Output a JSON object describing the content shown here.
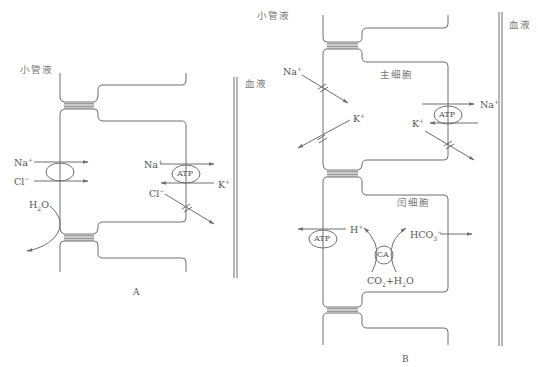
{
  "panel_a": {
    "caption": "A",
    "lumen_label": "小管液",
    "blood_label": "血液",
    "ions": {
      "na_in": "Na",
      "cl_in": "Cl",
      "water": "H2O",
      "na_pump": "Na",
      "k_pump": "K",
      "cl_out": "Cl"
    },
    "pump_label": "ATP"
  },
  "panel_b": {
    "caption": "B",
    "lumen_label": "小管液",
    "blood_label": "血液",
    "principal_cell_label": "主细胞",
    "intercalated_cell_label": "闰细胞",
    "ions": {
      "na_in": "Na",
      "k_center": "K",
      "na_pump": "Na",
      "k_pump": "K",
      "h_out": "H",
      "hco3": "HCO",
      "co2_h2o": "CO2+H2O"
    },
    "pump_label": "ATP",
    "enzyme_label": "CA"
  },
  "colors": {
    "line": "#6e6e6e",
    "text": "#666666"
  }
}
